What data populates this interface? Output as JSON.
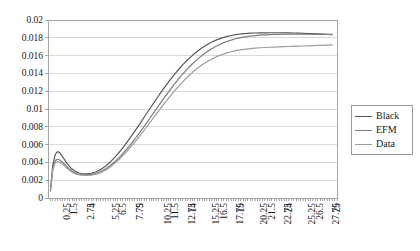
{
  "chart_data": {
    "type": "line",
    "title": "",
    "xlabel": "",
    "ylabel": "",
    "grid": true,
    "legend_position": "right",
    "xlim": [
      0,
      30
    ],
    "ylim": [
      0,
      0.02
    ],
    "y_ticks": [
      "0",
      "0.002",
      "0.004",
      "0.006",
      "0.008",
      "0.01",
      "0.012",
      "0.014",
      "0.016",
      "0.018",
      "0.02"
    ],
    "y_tick_values": [
      0,
      0.002,
      0.004,
      0.006,
      0.008,
      0.01,
      0.012,
      0.014,
      0.016,
      0.018,
      0.02
    ],
    "x_tick_labels": [
      "0.25",
      "1.5",
      "2.75",
      "4",
      "5.25",
      "6.5",
      "7.75",
      "9",
      "10.25",
      "11.5",
      "12.75",
      "14",
      "15.25",
      "16.5",
      "17.75",
      "19",
      "20.25",
      "21.5",
      "22.75",
      "24",
      "25.25",
      "26.5",
      "27.75",
      "29"
    ],
    "x_tick_values": [
      0.25,
      1.5,
      2.75,
      4,
      5.25,
      6.5,
      7.75,
      9,
      10.25,
      11.5,
      12.75,
      14,
      15.25,
      16.5,
      17.75,
      19,
      20.25,
      21.5,
      22.75,
      24,
      25.25,
      26.5,
      27.75,
      29
    ],
    "x_minor_tick_step": 0.25,
    "x": [
      0.25,
      0.5,
      0.75,
      1,
      1.25,
      1.5,
      1.75,
      2,
      2.25,
      2.5,
      2.75,
      3,
      3.25,
      3.5,
      3.75,
      4,
      4.5,
      5,
      5.5,
      6,
      6.5,
      7,
      7.5,
      8,
      8.5,
      9,
      9.5,
      10,
      10.5,
      11,
      11.5,
      12,
      12.5,
      13,
      13.5,
      14,
      14.5,
      15,
      15.5,
      16,
      16.5,
      17,
      17.5,
      18,
      18.5,
      19,
      19.5,
      20,
      20.5,
      21,
      21.5,
      22,
      22.5,
      23,
      23.5,
      24,
      24.5,
      25,
      25.5,
      26,
      26.5,
      27,
      27.5,
      28,
      28.5,
      29,
      29.5
    ],
    "series": [
      {
        "name": "Black",
        "color": "#595959",
        "values": [
          0.0008,
          0.0037,
          0.0049,
          0.00522,
          0.00505,
          0.00465,
          0.00425,
          0.00385,
          0.00352,
          0.00325,
          0.00305,
          0.0029,
          0.00281,
          0.00275,
          0.00272,
          0.00272,
          0.00278,
          0.00295,
          0.00322,
          0.0036,
          0.00408,
          0.00465,
          0.00528,
          0.00598,
          0.00672,
          0.00748,
          0.00828,
          0.0091,
          0.00992,
          0.01072,
          0.01152,
          0.01228,
          0.01302,
          0.01372,
          0.01438,
          0.01498,
          0.01553,
          0.01603,
          0.01648,
          0.01688,
          0.01722,
          0.01752,
          0.01777,
          0.01797,
          0.01813,
          0.01826,
          0.01836,
          0.01843,
          0.01848,
          0.01852,
          0.01854,
          0.01855,
          0.01856,
          0.01857,
          0.01857,
          0.01857,
          0.01856,
          0.01855,
          0.01854,
          0.01852,
          0.0185,
          0.01848,
          0.01846,
          0.01844,
          0.01842,
          0.0184,
          0.01838
        ]
      },
      {
        "name": "EFM",
        "color": "#7d7d7d",
        "values": [
          0.0008,
          0.0033,
          0.0042,
          0.00435,
          0.00425,
          0.00402,
          0.00375,
          0.00348,
          0.00322,
          0.003,
          0.00285,
          0.00275,
          0.00268,
          0.00264,
          0.00262,
          0.00262,
          0.00266,
          0.00278,
          0.00298,
          0.00328,
          0.00368,
          0.00415,
          0.00468,
          0.00528,
          0.00592,
          0.0066,
          0.00732,
          0.00808,
          0.00885,
          0.00962,
          0.0104,
          0.01116,
          0.0119,
          0.01262,
          0.0133,
          0.01394,
          0.01453,
          0.01508,
          0.01558,
          0.01603,
          0.01643,
          0.01678,
          0.01708,
          0.01734,
          0.01756,
          0.01774,
          0.01789,
          0.01801,
          0.01811,
          0.01819,
          0.01825,
          0.0183,
          0.01833,
          0.01836,
          0.01838,
          0.01839,
          0.0184,
          0.01841,
          0.01841,
          0.01841,
          0.01841,
          0.0184,
          0.0184,
          0.01839,
          0.01838,
          0.01837,
          0.01836
        ]
      },
      {
        "name": "Data",
        "color": "#9c9c9c",
        "values": [
          0.0008,
          0.00318,
          0.00398,
          0.00408,
          0.00398,
          0.00378,
          0.00355,
          0.0033,
          0.00308,
          0.00289,
          0.00275,
          0.00266,
          0.0026,
          0.00256,
          0.00254,
          0.00254,
          0.00258,
          0.00269,
          0.00288,
          0.00315,
          0.00352,
          0.00396,
          0.00446,
          0.00502,
          0.00562,
          0.00626,
          0.00694,
          0.00764,
          0.00836,
          0.00908,
          0.0098,
          0.01051,
          0.0112,
          0.01186,
          0.01249,
          0.01308,
          0.01362,
          0.01412,
          0.01457,
          0.01497,
          0.01532,
          0.01562,
          0.01588,
          0.0161,
          0.01628,
          0.01643,
          0.01655,
          0.01665,
          0.01673,
          0.01679,
          0.01684,
          0.01688,
          0.01691,
          0.01694,
          0.01696,
          0.01698,
          0.017,
          0.01702,
          0.01704,
          0.01706,
          0.01708,
          0.0171,
          0.01712,
          0.01714,
          0.01716,
          0.01718,
          0.0172
        ]
      }
    ]
  },
  "legend": {
    "items": [
      {
        "label": "Black",
        "color": "#595959"
      },
      {
        "label": "EFM",
        "color": "#7d7d7d"
      },
      {
        "label": "Data",
        "color": "#9c9c9c"
      }
    ]
  },
  "axes": {
    "grid_color": "#d9d9d9",
    "axis_color": "#a6a6a6"
  }
}
